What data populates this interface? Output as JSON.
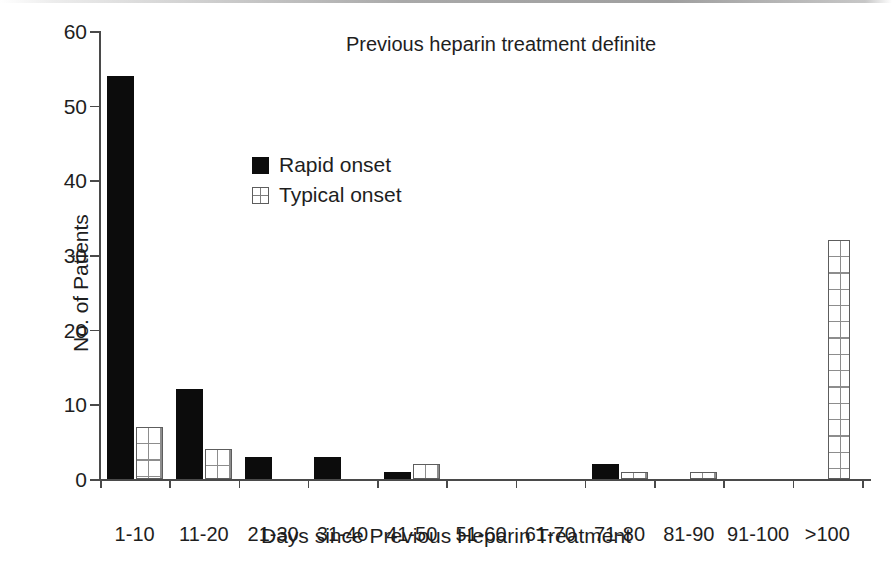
{
  "chart_data": {
    "type": "bar",
    "title": "Previous heparin treatment definite",
    "xlabel": "Days since Previous Heparin Treatment",
    "ylabel": "No. of Patients",
    "categories": [
      "1-10",
      "11-20",
      "21-30",
      "31-40",
      "41-50",
      "51-60",
      "61-70",
      "71-80",
      "81-90",
      "91-100",
      ">100"
    ],
    "series": [
      {
        "name": "Rapid onset",
        "color": "#0c0c0c",
        "pattern": "solid",
        "values": [
          54,
          12,
          3,
          3,
          1,
          0,
          0,
          2,
          0,
          0,
          0
        ]
      },
      {
        "name": "Typical onset",
        "color": "#ffffff",
        "pattern": "grid",
        "values": [
          7,
          4,
          0,
          0,
          2,
          0,
          0,
          1,
          1,
          0,
          32
        ]
      }
    ],
    "ylim": [
      0,
      60
    ],
    "yticks": [
      0,
      10,
      20,
      30,
      40,
      50,
      60
    ],
    "ytick_labels": [
      "0",
      "10",
      "20",
      "30",
      "40",
      "50",
      "60"
    ],
    "grid": false,
    "legend_position": "upper-left-inside"
  }
}
